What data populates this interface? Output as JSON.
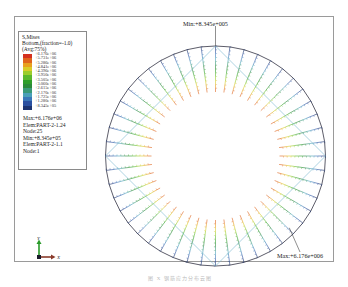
{
  "legend": {
    "title": "S,Mises",
    "subtitle": "Bottom,(fraction=-1.0)",
    "avg": "(Avg:75%)",
    "values": [
      "+6.176e+06",
      "+5.731e+06",
      "+5.286e+06",
      "+4.841e+06",
      "+4.396e+06",
      "+3.950e+06",
      "+3.505e+06",
      "+3.060e+06",
      "+2.615e+06",
      "+2.170e+06",
      "+1.725e+06",
      "+1.280e+06",
      "+8.345e+05"
    ],
    "colors": [
      "#d4301e",
      "#e0651e",
      "#e8a020",
      "#d9cc2a",
      "#9ccd2c",
      "#5ab82e",
      "#2e9e2a",
      "#2a8a3a",
      "#3a9a78",
      "#4aa0b8",
      "#3a78b8",
      "#2a50a0",
      "#1c3470"
    ],
    "max_line": "Max:+6.176e+06",
    "max_elem": "Elem:PART-2-1.24",
    "max_node": "Node:25",
    "min_line": "Min:+8.345e+05",
    "min_elem": "Elem:PART-2-1.1",
    "min_node": "Node:1"
  },
  "annotations": {
    "min_label": "Min:+8.345e+005",
    "max_label": "Max:+6.176e+006"
  },
  "triad": {
    "y_label": "Y",
    "x_label": "X"
  },
  "model": {
    "center": [
      215.5,
      156
    ],
    "outer_radius": 110,
    "inner_radius": 64,
    "spoke_count": 48
  },
  "caption": "图 X  钢筋应力分布云图"
}
